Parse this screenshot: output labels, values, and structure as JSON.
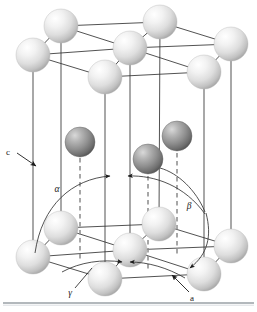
{
  "figure": {
    "name": "hexagonal-close-packed-unit-cell",
    "background_color": "#ffffff"
  },
  "labels": {
    "c_axis": "c",
    "a_axis": "a",
    "alpha": "α",
    "beta": "β",
    "gamma": "γ"
  },
  "colors": {
    "atom_light_fill": "#e8e8e8",
    "atom_light_highlight": "#ffffff",
    "atom_light_shadow": "#9a9a9a",
    "atom_dark_fill": "#8d8d8d",
    "atom_dark_highlight": "#d8d8d8",
    "atom_dark_shadow": "#4a4a4a",
    "edge_line": "#333333",
    "dashed_line": "#8a8a8a",
    "label_text": "#1a1a1a",
    "rule_line": "#9aa0a6"
  },
  "geometry": {
    "width": 257,
    "height": 312,
    "atom_radius_corner": 17,
    "atom_radius_mid": 15,
    "top_plane_y": 48,
    "bottom_plane_y": 250
  },
  "atoms": {
    "top_layer": [
      {
        "id": "top-back-left",
        "cx": 61,
        "cy": 26,
        "r": 17,
        "shade": "light"
      },
      {
        "id": "top-back-right",
        "cx": 160,
        "cy": 22,
        "r": 17,
        "shade": "light"
      },
      {
        "id": "top-left",
        "cx": 33,
        "cy": 55,
        "r": 17,
        "shade": "light"
      },
      {
        "id": "top-center",
        "cx": 130,
        "cy": 48,
        "r": 17,
        "shade": "light"
      },
      {
        "id": "top-right",
        "cx": 231,
        "cy": 44,
        "r": 17,
        "shade": "light"
      },
      {
        "id": "top-front-left",
        "cx": 105,
        "cy": 77,
        "r": 17,
        "shade": "light"
      },
      {
        "id": "top-front-right",
        "cx": 204,
        "cy": 72,
        "r": 17,
        "shade": "light"
      }
    ],
    "middle_layer": [
      {
        "id": "mid-left",
        "cx": 80,
        "cy": 142,
        "r": 15,
        "shade": "dark"
      },
      {
        "id": "mid-right",
        "cx": 177,
        "cy": 136,
        "r": 15,
        "shade": "dark"
      },
      {
        "id": "mid-front",
        "cx": 148,
        "cy": 159,
        "r": 15,
        "shade": "dark"
      }
    ],
    "bottom_layer": [
      {
        "id": "bottom-back-left",
        "cx": 61,
        "cy": 228,
        "r": 17,
        "shade": "light"
      },
      {
        "id": "bottom-back-right",
        "cx": 159,
        "cy": 224,
        "r": 17,
        "shade": "light"
      },
      {
        "id": "bottom-left",
        "cx": 33,
        "cy": 257,
        "r": 17,
        "shade": "light"
      },
      {
        "id": "bottom-center",
        "cx": 130,
        "cy": 250,
        "r": 17,
        "shade": "light"
      },
      {
        "id": "bottom-right",
        "cx": 231,
        "cy": 246,
        "r": 17,
        "shade": "light"
      },
      {
        "id": "bottom-front-left",
        "cx": 105,
        "cy": 279,
        "r": 17,
        "shade": "light"
      },
      {
        "id": "bottom-front-right",
        "cx": 204,
        "cy": 274,
        "r": 17,
        "shade": "light"
      }
    ]
  },
  "label_positions": {
    "c": {
      "x": 8,
      "y": 155
    },
    "alpha": {
      "x": 57,
      "y": 190
    },
    "beta": {
      "x": 185,
      "y": 205
    },
    "gamma": {
      "x": 71,
      "y": 293
    },
    "a": {
      "x": 190,
      "y": 299
    }
  },
  "rule": {
    "y": 303,
    "x1": 3,
    "x2": 254
  }
}
